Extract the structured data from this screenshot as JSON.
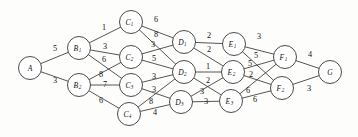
{
  "figure": {
    "name": "layered-weighted-network-diagram",
    "background_color": "#fdfdfc",
    "line_color": "#2b2b2b",
    "text_color": "#121212",
    "width": 358,
    "height": 137
  },
  "chart_data": {
    "type": "diagram",
    "title": "",
    "subtitle": "",
    "xlabel": "",
    "ylabel": "",
    "graph_type": "layered directed weighted network",
    "layout_hint": "stages left-to-right: A, B, C, D, E, F, G",
    "legend": [],
    "stages": [
      {
        "name": "A",
        "nodes": [
          "A"
        ]
      },
      {
        "name": "B",
        "nodes": [
          "B1",
          "B2"
        ]
      },
      {
        "name": "C",
        "nodes": [
          "C1",
          "C2",
          "C3",
          "C4"
        ]
      },
      {
        "name": "D",
        "nodes": [
          "D1",
          "D2",
          "D3"
        ]
      },
      {
        "name": "E",
        "nodes": [
          "E1",
          "E2",
          "E3"
        ]
      },
      {
        "name": "F",
        "nodes": [
          "F1",
          "F2"
        ]
      },
      {
        "name": "G",
        "nodes": [
          "G"
        ]
      }
    ],
    "nodes": [
      {
        "id": "A",
        "base": "A",
        "sub": "",
        "x": 30,
        "y": 68,
        "r": 11.5
      },
      {
        "id": "B1",
        "base": "B",
        "sub": "1",
        "x": 79,
        "y": 48,
        "r": 11.5
      },
      {
        "id": "B2",
        "base": "B",
        "sub": "2",
        "x": 79,
        "y": 85,
        "r": 11.5
      },
      {
        "id": "C1",
        "base": "C",
        "sub": "1",
        "x": 131,
        "y": 22,
        "r": 11.5
      },
      {
        "id": "C2",
        "base": "C",
        "sub": "2",
        "x": 131,
        "y": 57,
        "r": 11.5
      },
      {
        "id": "C3",
        "base": "C",
        "sub": "3",
        "x": 131,
        "y": 85,
        "r": 11.5
      },
      {
        "id": "C4",
        "base": "C",
        "sub": "4",
        "x": 129,
        "y": 114,
        "r": 11.5
      },
      {
        "id": "D1",
        "base": "D",
        "sub": "1",
        "x": 184,
        "y": 42,
        "r": 11.5
      },
      {
        "id": "D2",
        "base": "D",
        "sub": "2",
        "x": 184,
        "y": 72,
        "r": 11.5
      },
      {
        "id": "D3",
        "base": "D",
        "sub": "3",
        "x": 181,
        "y": 102,
        "r": 11.5
      },
      {
        "id": "E1",
        "base": "E",
        "sub": "1",
        "x": 234,
        "y": 44,
        "r": 11.5
      },
      {
        "id": "E2",
        "base": "E",
        "sub": "2",
        "x": 233,
        "y": 72,
        "r": 11.5
      },
      {
        "id": "E3",
        "base": "E",
        "sub": "3",
        "x": 231,
        "y": 101,
        "r": 11.5
      },
      {
        "id": "F1",
        "base": "F",
        "sub": "1",
        "x": 285,
        "y": 57,
        "r": 11.5
      },
      {
        "id": "F2",
        "base": "F",
        "sub": "2",
        "x": 282,
        "y": 88,
        "r": 11.5
      },
      {
        "id": "G",
        "base": "G",
        "sub": "",
        "x": 330,
        "y": 72,
        "r": 11.5
      }
    ],
    "edges": [
      {
        "from": "A",
        "to": "B1",
        "weight": 5,
        "lx": 55,
        "ly": 48
      },
      {
        "from": "A",
        "to": "B2",
        "weight": 3,
        "lx": 55,
        "ly": 80
      },
      {
        "from": "B1",
        "to": "C1",
        "weight": 1,
        "lx": 104,
        "ly": 27
      },
      {
        "from": "B1",
        "to": "C2",
        "weight": 3,
        "lx": 105,
        "ly": 46
      },
      {
        "from": "B1",
        "to": "C3",
        "weight": 6,
        "lx": 104,
        "ly": 59
      },
      {
        "from": "B2",
        "to": "C2",
        "weight": 8,
        "lx": 101,
        "ly": 74
      },
      {
        "from": "B2",
        "to": "C3",
        "weight": 7,
        "lx": 105,
        "ly": 84
      },
      {
        "from": "B2",
        "to": "C4",
        "weight": 6,
        "lx": 101,
        "ly": 100
      },
      {
        "from": "C1",
        "to": "D1",
        "weight": 6,
        "lx": 156,
        "ly": 19
      },
      {
        "from": "C1",
        "to": "D2",
        "weight": 8,
        "lx": 156,
        "ly": 34
      },
      {
        "from": "C2",
        "to": "D1",
        "weight": 3,
        "lx": 153,
        "ly": 44
      },
      {
        "from": "C2",
        "to": "D2",
        "weight": 5,
        "lx": 154,
        "ly": 58
      },
      {
        "from": "C3",
        "to": "D2",
        "weight": 3,
        "lx": 154,
        "ly": 76
      },
      {
        "from": "C3",
        "to": "D3",
        "weight": 3,
        "lx": 154,
        "ly": 89
      },
      {
        "from": "C4",
        "to": "D2",
        "weight": 8,
        "lx": 151,
        "ly": 101
      },
      {
        "from": "C4",
        "to": "D3",
        "weight": 4,
        "lx": 155,
        "ly": 112
      },
      {
        "from": "D1",
        "to": "E1",
        "weight": 2,
        "lx": 209,
        "ly": 35
      },
      {
        "from": "D1",
        "to": "E2",
        "weight": 2,
        "lx": 209,
        "ly": 49
      },
      {
        "from": "D2",
        "to": "E2",
        "weight": 1,
        "lx": 208,
        "ly": 66
      },
      {
        "from": "D2",
        "to": "E3",
        "weight": 2,
        "lx": 208,
        "ly": 80
      },
      {
        "from": "D3",
        "to": "E2",
        "weight": 3,
        "lx": 202,
        "ly": 91
      },
      {
        "from": "D3",
        "to": "E3",
        "weight": 3,
        "lx": 206,
        "ly": 101
      },
      {
        "from": "E1",
        "to": "F1",
        "weight": 3,
        "lx": 259,
        "ly": 36
      },
      {
        "from": "E1",
        "to": "F2",
        "weight": 5,
        "lx": 256,
        "ly": 55
      },
      {
        "from": "E2",
        "to": "F1",
        "weight": 5,
        "lx": 250,
        "ly": 63
      },
      {
        "from": "E2",
        "to": "F2",
        "weight": 2,
        "lx": 251,
        "ly": 74
      },
      {
        "from": "E3",
        "to": "F1",
        "weight": 6,
        "lx": 248,
        "ly": 90
      },
      {
        "from": "E3",
        "to": "F2",
        "weight": 6,
        "lx": 255,
        "ly": 99
      },
      {
        "from": "F1",
        "to": "G",
        "weight": 4,
        "lx": 310,
        "ly": 54
      },
      {
        "from": "F2",
        "to": "G",
        "weight": 3,
        "lx": 309,
        "ly": 88
      }
    ]
  }
}
